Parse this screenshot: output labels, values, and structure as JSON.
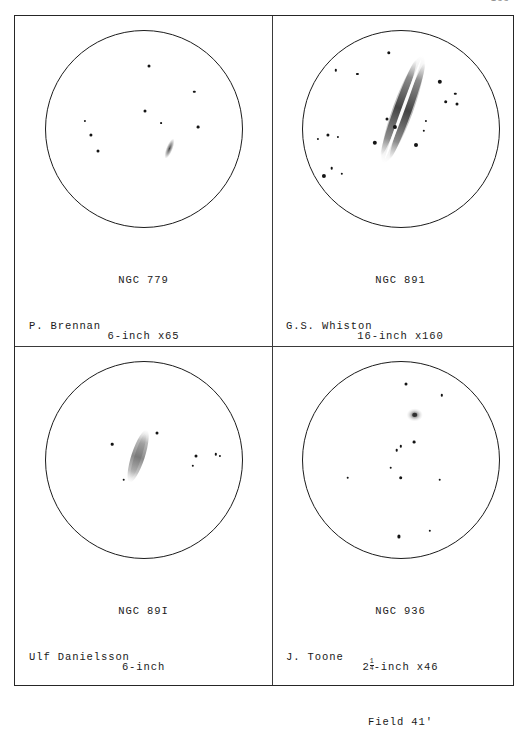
{
  "page": {
    "number": "133",
    "plate_border_color": "#262626"
  },
  "panels": [
    {
      "id": "top-left",
      "object": "NGC 779",
      "instrument": "6-inch x65",
      "field": "Field 46'",
      "observer": "P. Brennan",
      "sketch": {
        "type": "eyepiece-field",
        "galaxy": {
          "name": "NGC 779",
          "form": "small faint elongated streak",
          "cx": 63,
          "cy": 60,
          "len": 11,
          "wid": 3.4,
          "angle": 22
        },
        "stars": [
          {
            "x": 53,
            "y": 18,
            "r": 1.5
          },
          {
            "x": 76,
            "y": 31,
            "r": 1.2
          },
          {
            "x": 51,
            "y": 41,
            "r": 1.5
          },
          {
            "x": 20,
            "y": 46,
            "r": 1.1
          },
          {
            "x": 59,
            "y": 47,
            "r": 0.9
          },
          {
            "x": 78,
            "y": 49,
            "r": 1.4
          },
          {
            "x": 23,
            "y": 53,
            "r": 1.6
          },
          {
            "x": 27,
            "y": 61,
            "r": 1.5
          }
        ]
      }
    },
    {
      "id": "top-right",
      "object": "NGC 891",
      "instrument": "16-inch x160",
      "field": "Field 14'",
      "observer": "G.S. Whiston",
      "sketch": {
        "type": "eyepiece-field",
        "galaxy": {
          "name": "NGC 891",
          "form": "edge-on spindle bisected by dark dust lane",
          "cx": 51,
          "cy": 40,
          "len": 58,
          "wid": 9,
          "angle": 20
        },
        "stars": [
          {
            "x": 44,
            "y": 11,
            "r": 1.7
          },
          {
            "x": 17,
            "y": 20,
            "r": 1.2
          },
          {
            "x": 28,
            "y": 22,
            "r": 1.1
          },
          {
            "x": 70,
            "y": 26,
            "r": 2.2
          },
          {
            "x": 78,
            "y": 32,
            "r": 1.2
          },
          {
            "x": 73,
            "y": 36,
            "r": 1.8
          },
          {
            "x": 79,
            "y": 37,
            "r": 1.5
          },
          {
            "x": 43,
            "y": 45,
            "r": 1.5
          },
          {
            "x": 63,
            "y": 46,
            "r": 1.1
          },
          {
            "x": 47,
            "y": 49,
            "r": 2.1
          },
          {
            "x": 62,
            "y": 51,
            "r": 1.2
          },
          {
            "x": 13,
            "y": 53,
            "r": 1.6
          },
          {
            "x": 8,
            "y": 55,
            "r": 1.1
          },
          {
            "x": 18,
            "y": 54,
            "r": 1.1
          },
          {
            "x": 37,
            "y": 57,
            "r": 2.2
          },
          {
            "x": 58,
            "y": 58,
            "r": 2.0
          },
          {
            "x": 15,
            "y": 70,
            "r": 1.3
          },
          {
            "x": 20,
            "y": 73,
            "r": 1.2
          },
          {
            "x": 11,
            "y": 74,
            "r": 2.1
          }
        ]
      }
    },
    {
      "id": "bottom-left",
      "object": "NGC 89I",
      "instrument": "6-inch",
      "field": "",
      "observer": "Ulf Danielsson",
      "sketch": {
        "type": "eyepiece-field",
        "galaxy": {
          "name": "NGC 891",
          "form": "faint narrow streak",
          "cx": 47,
          "cy": 48,
          "len": 27,
          "wid": 5.5,
          "angle": 18
        },
        "stars": [
          {
            "x": 57,
            "y": 36,
            "r": 1.5
          },
          {
            "x": 34,
            "y": 42,
            "r": 1.3
          },
          {
            "x": 77,
            "y": 48,
            "r": 1.5
          },
          {
            "x": 87,
            "y": 47,
            "r": 1.2
          },
          {
            "x": 89,
            "y": 48,
            "r": 1.1
          },
          {
            "x": 75,
            "y": 53,
            "r": 1.2
          },
          {
            "x": 40,
            "y": 60,
            "r": 1.3
          }
        ]
      }
    },
    {
      "id": "bottom-right",
      "object": "NGC 936",
      "instrument": "2¼-inch x46",
      "instrument_whole": "2",
      "instrument_num": "1",
      "instrument_den": "4",
      "instrument_tail": "-inch x46",
      "field": "Field 41'",
      "observer": "J. Toone",
      "sketch": {
        "type": "eyepiece-field",
        "galaxy": {
          "name": "NGC 936",
          "form": "small round hazy glow with stellar nucleus",
          "cx": 57,
          "cy": 27,
          "len": 7,
          "wid": 6,
          "angle": 0
        },
        "stars": [
          {
            "x": 53,
            "y": 11,
            "r": 1.5
          },
          {
            "x": 71,
            "y": 17,
            "r": 1.2
          },
          {
            "x": 57,
            "y": 41,
            "r": 1.4
          },
          {
            "x": 50,
            "y": 43,
            "r": 1.2
          },
          {
            "x": 48,
            "y": 45,
            "r": 1.3
          },
          {
            "x": 45,
            "y": 54,
            "r": 1.3
          },
          {
            "x": 50,
            "y": 59,
            "r": 1.8
          },
          {
            "x": 23,
            "y": 59,
            "r": 1.3
          },
          {
            "x": 70,
            "y": 60,
            "r": 1.3
          },
          {
            "x": 49,
            "y": 89,
            "r": 1.6
          },
          {
            "x": 65,
            "y": 86,
            "r": 1.2
          }
        ]
      }
    }
  ]
}
